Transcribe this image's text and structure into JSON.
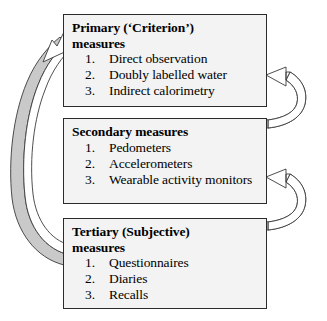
{
  "diagram": {
    "background_color": "#ffffff",
    "box_fill_color": "#f3f3f3",
    "box_border_color": "#2b2b2b",
    "arrow_fill_color": "#ffffff",
    "arrow_shadow_color": "#c9c9c9",
    "arrow_outline_color": "#3a3a3a"
  },
  "boxes": [
    {
      "id": "primary",
      "title": "Primary (‘Criterion’) measures",
      "title_line_1": "Primary (‘Criterion’)",
      "title_line_2": "measures",
      "items": [
        {
          "number": "1.",
          "text": "Direct observation"
        },
        {
          "number": "2.",
          "text": "Doubly labelled water"
        },
        {
          "number": "3.",
          "text": "Indirect calorimetry"
        }
      ]
    },
    {
      "id": "secondary",
      "title": "Secondary measures",
      "title_line_1": "Secondary measures",
      "title_line_2": "",
      "items": [
        {
          "number": "1.",
          "text": "Pedometers"
        },
        {
          "number": "2.",
          "text": "Accelerometers"
        },
        {
          "number": "3.",
          "text": "Wearable activity monitors"
        }
      ]
    },
    {
      "id": "tertiary",
      "title": "Tertiary (Subjective) measures",
      "title_line_1": "Tertiary (Subjective)",
      "title_line_2": "measures",
      "items": [
        {
          "number": "1.",
          "text": "Questionnaires"
        },
        {
          "number": "2.",
          "text": "Diaries"
        },
        {
          "number": "3.",
          "text": "Recalls"
        }
      ]
    }
  ],
  "arrows": [
    {
      "id": "secondary-to-primary",
      "label": "curved arrow from Secondary measures to Primary measures",
      "from": "secondary",
      "to": "primary",
      "side": "right"
    },
    {
      "id": "tertiary-to-secondary",
      "label": "curved arrow from Tertiary measures to Secondary measures",
      "from": "tertiary",
      "to": "secondary",
      "side": "right"
    },
    {
      "id": "tertiary-to-primary",
      "label": "large curved arrow from Tertiary measures to Primary measures",
      "from": "tertiary",
      "to": "primary",
      "side": "left"
    }
  ]
}
